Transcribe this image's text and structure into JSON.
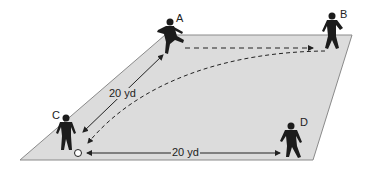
{
  "diagram": {
    "type": "soccer-drill",
    "field": {
      "fill": "#dcdcdc",
      "stroke": "#8a8a8a",
      "corners": [
        [
          165,
          35
        ],
        [
          352,
          35
        ],
        [
          313,
          160
        ],
        [
          20,
          160
        ]
      ]
    },
    "players": [
      {
        "id": "A",
        "label": "A",
        "x": 168,
        "y": 26
      },
      {
        "id": "B",
        "label": "B",
        "x": 330,
        "y": 26
      },
      {
        "id": "C",
        "label": "C",
        "x": 67,
        "y": 137
      },
      {
        "id": "D",
        "label": "D",
        "x": 290,
        "y": 140
      }
    ],
    "ball": {
      "x": 78,
      "y": 153
    },
    "distances": [
      {
        "id": "c-to-a",
        "label": "20 yd",
        "from": "C",
        "to": "A"
      },
      {
        "id": "c-to-d",
        "label": "20 yd",
        "from": "C",
        "to": "D"
      }
    ],
    "passes": [
      {
        "id": "a-to-b",
        "style": "dashed",
        "from": "A",
        "to": "B"
      },
      {
        "id": "b-to-c",
        "style": "dashed-curved",
        "from": "B",
        "to": "C"
      }
    ],
    "colors": {
      "player": "#1c1c1c",
      "line": "#222222",
      "ball": "#ffffff"
    }
  }
}
